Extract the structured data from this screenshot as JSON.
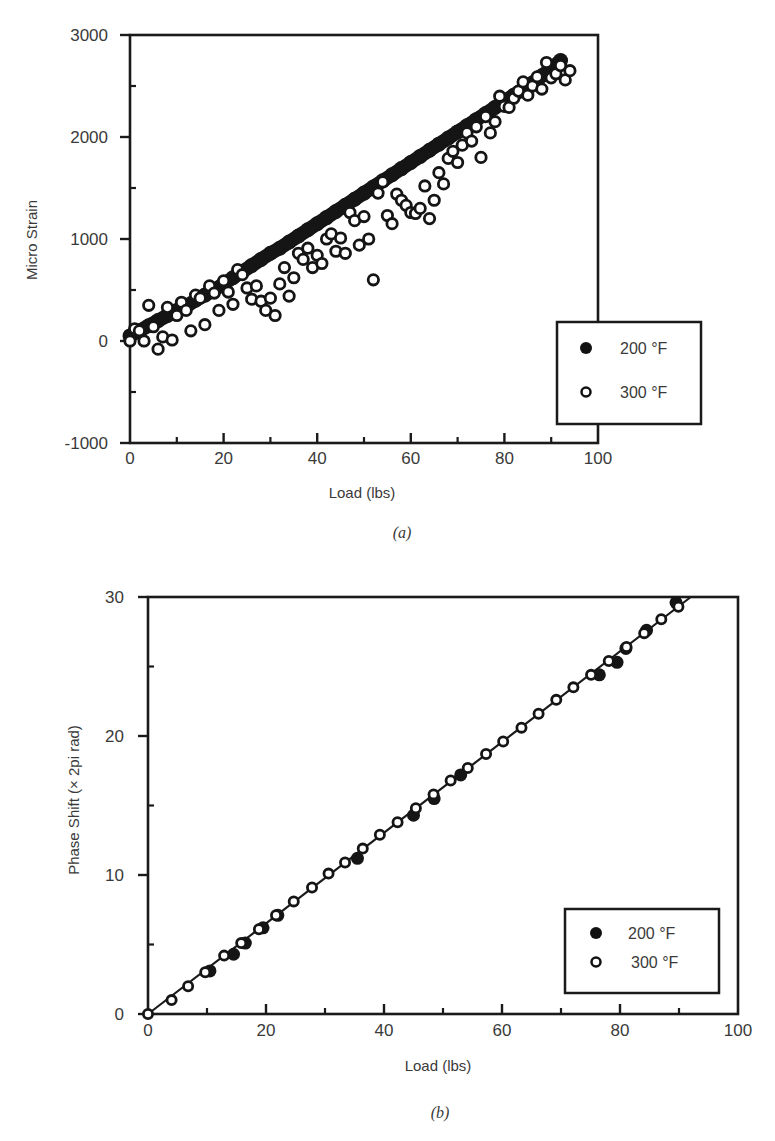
{
  "chart_data": [
    {
      "id": "a",
      "type": "scatter",
      "caption": "(a)",
      "title": "",
      "xlabel": "Load (lbs)",
      "ylabel": "Micro Strain",
      "xlim": [
        0,
        100
      ],
      "ylim": [
        -1000,
        3000
      ],
      "xticks": [
        0,
        20,
        40,
        60,
        80,
        100
      ],
      "yticks": [
        -1000,
        0,
        1000,
        2000,
        3000
      ],
      "grid": false,
      "legend_position": "lower right",
      "series": [
        {
          "name": "200 °F",
          "marker": "filled-circle",
          "x": [
            0,
            2,
            4,
            6,
            8,
            10,
            12,
            14,
            16,
            18,
            20,
            22,
            24,
            26,
            28,
            30,
            32,
            34,
            36,
            38,
            40,
            42,
            44,
            46,
            48,
            50,
            52,
            54,
            56,
            58,
            60,
            62,
            64,
            66,
            68,
            70,
            72,
            74,
            76,
            78,
            80,
            82,
            84,
            86,
            88,
            90,
            92
          ],
          "y": [
            50,
            100,
            150,
            200,
            250,
            300,
            340,
            400,
            450,
            500,
            560,
            620,
            680,
            740,
            800,
            860,
            910,
            970,
            1030,
            1090,
            1150,
            1210,
            1270,
            1330,
            1390,
            1450,
            1510,
            1570,
            1630,
            1690,
            1750,
            1810,
            1870,
            1930,
            1990,
            2050,
            2110,
            2170,
            2230,
            2290,
            2350,
            2410,
            2470,
            2530,
            2600,
            2670,
            2750
          ]
        },
        {
          "name": "300 °F",
          "marker": "open-circle",
          "x": [
            0,
            1,
            2,
            3,
            4,
            5,
            6,
            7,
            8,
            9,
            10,
            11,
            12,
            13,
            14,
            15,
            16,
            17,
            18,
            19,
            20,
            21,
            22,
            23,
            24,
            25,
            26,
            27,
            28,
            29,
            30,
            31,
            32,
            33,
            34,
            35,
            36,
            37,
            38,
            39,
            40,
            41,
            42,
            43,
            44,
            45,
            46,
            47,
            48,
            49,
            50,
            51,
            52,
            53,
            54,
            55,
            56,
            57,
            58,
            59,
            60,
            61,
            62,
            63,
            64,
            65,
            66,
            67,
            68,
            69,
            70,
            71,
            72,
            73,
            74,
            75,
            76,
            77,
            78,
            79,
            80,
            81,
            82,
            83,
            84,
            85,
            86,
            87,
            88,
            89,
            90,
            91,
            92,
            93,
            94
          ],
          "y": [
            0,
            120,
            100,
            0,
            350,
            140,
            -80,
            40,
            330,
            10,
            250,
            380,
            300,
            100,
            450,
            420,
            160,
            540,
            470,
            300,
            590,
            480,
            360,
            700,
            650,
            520,
            410,
            540,
            390,
            300,
            420,
            250,
            560,
            720,
            440,
            620,
            860,
            800,
            910,
            720,
            840,
            760,
            1000,
            1050,
            880,
            1010,
            860,
            1260,
            1180,
            940,
            1220,
            1000,
            600,
            1450,
            1560,
            1230,
            1150,
            1440,
            1380,
            1330,
            1260,
            1250,
            1300,
            1520,
            1200,
            1380,
            1650,
            1540,
            1790,
            1860,
            1750,
            1920,
            2040,
            1960,
            2100,
            1800,
            2200,
            2040,
            2150,
            2400,
            2300,
            2290,
            2380,
            2450,
            2540,
            2410,
            2500,
            2590,
            2470,
            2730,
            2580,
            2620,
            2700,
            2560,
            2650
          ]
        }
      ],
      "legend": [
        {
          "label": "200 °F",
          "marker": "filled-circle"
        },
        {
          "label": "300 °F",
          "marker": "open-circle"
        }
      ]
    },
    {
      "id": "b",
      "type": "scatter",
      "caption": "(b)",
      "title": "",
      "xlabel": "Load (lbs)",
      "ylabel": "Phase Shift (× 2pi rad)",
      "xlim": [
        0,
        100
      ],
      "ylim": [
        0,
        30
      ],
      "xticks": [
        0,
        20,
        40,
        60,
        80,
        100
      ],
      "yticks": [
        0,
        10,
        20,
        30
      ],
      "grid": false,
      "legend_position": "lower right",
      "fit_line": {
        "x": [
          0,
          92
        ],
        "y": [
          0,
          30
        ]
      },
      "series": [
        {
          "name": "200 °F",
          "marker": "filled-circle",
          "x": [
            10.5,
            14.5,
            16.5,
            19.5,
            22.0,
            35.5,
            45.0,
            48.5,
            53.0,
            76.5,
            79.5,
            81.0,
            84.5,
            89.5
          ],
          "y": [
            3.1,
            4.3,
            5.1,
            6.2,
            7.1,
            11.2,
            14.3,
            15.5,
            17.2,
            24.4,
            25.3,
            26.3,
            27.6,
            29.6
          ]
        },
        {
          "name": "300 °F",
          "marker": "open-circle",
          "x": [
            0,
            4.0,
            6.8,
            9.7,
            12.9,
            15.8,
            18.8,
            21.7,
            24.7,
            27.8,
            30.6,
            33.4,
            36.4,
            39.3,
            42.3,
            45.4,
            48.4,
            51.3,
            54.2,
            57.3,
            60.2,
            63.3,
            66.2,
            69.2,
            72.1,
            75.1,
            78.1,
            81.1,
            84.1,
            87.0,
            89.9
          ],
          "y": [
            0,
            1.0,
            2.0,
            3.0,
            4.2,
            5.1,
            6.1,
            7.1,
            8.1,
            9.1,
            10.1,
            10.9,
            11.9,
            12.9,
            13.8,
            14.8,
            15.8,
            16.8,
            17.7,
            18.7,
            19.6,
            20.6,
            21.6,
            22.6,
            23.5,
            24.4,
            25.4,
            26.4,
            27.4,
            28.4,
            29.3
          ]
        }
      ],
      "legend": [
        {
          "label": "200 °F",
          "marker": "filled-circle"
        },
        {
          "label": "300 °F",
          "marker": "open-circle"
        }
      ]
    }
  ]
}
